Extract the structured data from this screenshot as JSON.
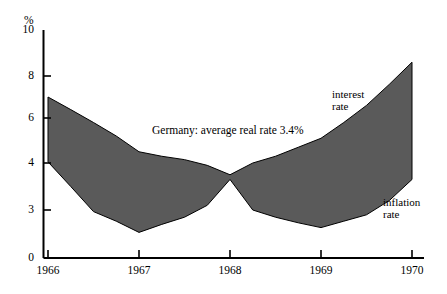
{
  "chart_data": {
    "type": "area",
    "title": "",
    "subtitle": "",
    "xlabel": "",
    "ylabel": "%",
    "ylim": [
      0,
      10
    ],
    "xlim": [
      1966,
      1970
    ],
    "grid": false,
    "legend_position": "inline-right",
    "annotation": "Germany: average real rate 3.4%",
    "y_ticks": [
      {
        "value": 0,
        "label": "0"
      },
      {
        "value": 3,
        "label": "3"
      },
      {
        "value": 4,
        "label": "4"
      },
      {
        "value": 6,
        "label": "6"
      },
      {
        "value": 8,
        "label": "8"
      },
      {
        "value": 10,
        "label": "10"
      }
    ],
    "x_ticks": [
      {
        "value": 1966,
        "label": "1966"
      },
      {
        "value": 1967,
        "label": "1967"
      },
      {
        "value": 1968,
        "label": "1968"
      },
      {
        "value": 1969,
        "label": "1969"
      },
      {
        "value": 1970,
        "label": "1970"
      }
    ],
    "series": [
      {
        "name": "interest rate",
        "label": "interest\nrate",
        "label_line1": "interest",
        "label_line2": "rate",
        "color": "#000000",
        "x": [
          1966.0,
          1966.25,
          1966.5,
          1966.75,
          1967.0,
          1967.25,
          1967.5,
          1967.75,
          1968.0,
          1968.25,
          1968.5,
          1968.75,
          1969.0,
          1969.25,
          1969.5,
          1969.75,
          1970.0
        ],
        "values": [
          7.0,
          6.4,
          5.8,
          5.2,
          4.5,
          4.3,
          4.15,
          3.95,
          3.75,
          4.0,
          4.3,
          4.7,
          5.1,
          5.8,
          6.6,
          7.6,
          8.6
        ]
      },
      {
        "name": "inflation rate",
        "label": "inflation\nrate",
        "label_line1": "inflation",
        "label_line2": "rate",
        "color": "#000000",
        "x": [
          1966.0,
          1966.25,
          1966.5,
          1966.75,
          1967.0,
          1967.25,
          1967.5,
          1967.75,
          1968.0,
          1968.25,
          1968.5,
          1968.75,
          1969.0,
          1969.25,
          1969.5,
          1969.75,
          1970.0
        ],
        "values": [
          4.05,
          3.5,
          2.9,
          2.3,
          1.6,
          2.1,
          2.55,
          3.1,
          3.65,
          3.0,
          2.55,
          2.2,
          1.9,
          2.3,
          2.7,
          3.2,
          3.65
        ]
      }
    ],
    "band_fill_color": "#5a5a5a",
    "band_description": "Shaded band between interest rate (upper) and inflation rate (lower) representing the real rate spread"
  },
  "axis": {
    "unit_label": "%"
  },
  "annotations": {
    "average_real_rate": "Germany: average real rate 3.4%",
    "interest_line1": "interest",
    "interest_line2": "rate",
    "inflation_line1": "inflation",
    "inflation_line2": "rate"
  }
}
